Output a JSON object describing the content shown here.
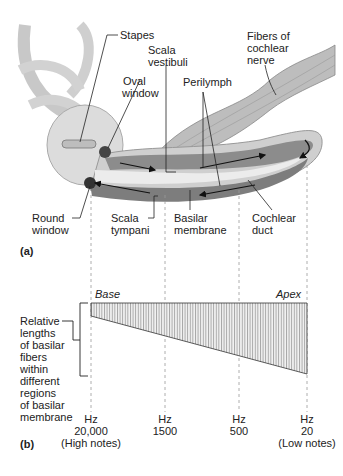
{
  "panel_a": {
    "letter": "(a)",
    "labels": {
      "stapes": "Stapes",
      "scala_vestibuli_1": "Scala",
      "scala_vestibuli_2": "vestibuli",
      "fibers_1": "Fibers of",
      "fibers_2": "cochlear",
      "fibers_3": "nerve",
      "oval_1": "Oval",
      "oval_2": "window",
      "perilymph": "Perilymph",
      "round_1": "Round",
      "round_2": "window",
      "tympani_1": "Scala",
      "tympani_2": "tympani",
      "basilar_1": "Basilar",
      "basilar_2": "membrane",
      "duct_1": "Cochlear",
      "duct_2": "duct"
    }
  },
  "panel_b": {
    "letter": "(b)",
    "base_label": "Base",
    "apex_label": "Apex",
    "side_label": [
      "Relative",
      "lengths",
      "of basilar",
      "fibers",
      "within",
      "different",
      "regions",
      "of basilar",
      "membrane"
    ],
    "ticks": [
      {
        "unit": "Hz",
        "value": "20,000",
        "note": "(High notes)"
      },
      {
        "unit": "Hz",
        "value": "1500",
        "note": ""
      },
      {
        "unit": "Hz",
        "value": "500",
        "note": ""
      },
      {
        "unit": "Hz",
        "value": "20",
        "note": "(Low notes)"
      }
    ]
  },
  "colors": {
    "bone": "#d9d9d9",
    "canal": "#8c8c8c",
    "duct": "#e8e8e8",
    "line": "#222222",
    "dash": "#9a9a9a"
  }
}
